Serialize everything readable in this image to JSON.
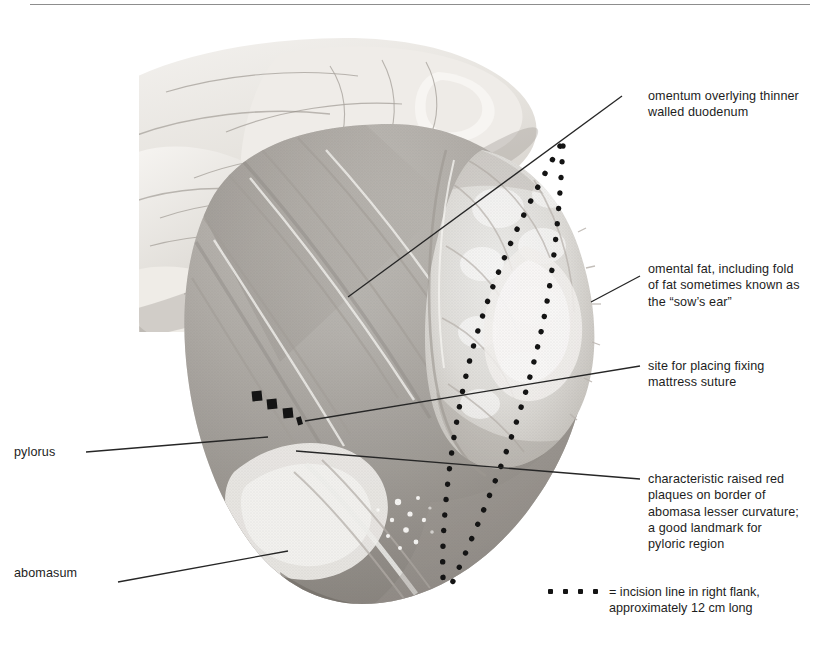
{
  "figure": {
    "kind": "anatomy-photograph",
    "rendering": "grayscale halftone photograph"
  },
  "annotations": [
    {
      "id": "omentum",
      "text": "omentum overlying thinner\nwalled duodenum",
      "side": "right"
    },
    {
      "id": "omental-fat",
      "text": "omental fat, including fold\nof fat sometimes known as\nthe “sow’s ear”",
      "side": "right"
    },
    {
      "id": "suture-site",
      "text": "site for placing fixing\nmattress suture",
      "side": "right"
    },
    {
      "id": "red-plaques",
      "text": "characteristic raised red\nplaques on border of\nabomasa lesser curvature;\na good landmark for\npyloric region",
      "side": "right"
    },
    {
      "id": "pylorus",
      "text": "pylorus",
      "side": "left"
    },
    {
      "id": "abomasum",
      "text": "abomasum",
      "side": "left"
    }
  ],
  "legend": {
    "symbol": "dotted-line",
    "dot_count": 4,
    "text": "= incision line in right flank,\napproximately 12 cm long"
  },
  "colors": {
    "text": "#1d1d1d",
    "leader_line": "#262626",
    "rule": "#8d8d8d",
    "marker": "#141414",
    "background": "#ffffff"
  }
}
